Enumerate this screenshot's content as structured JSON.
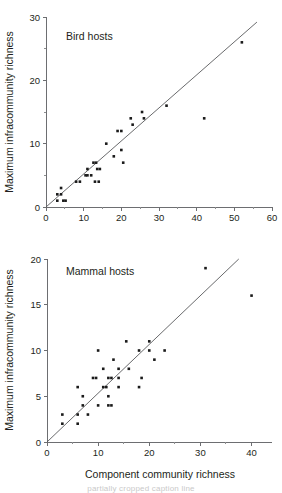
{
  "figure": {
    "shared_xlabel": "Component community richness",
    "shared_ylabel": "Maximum infracommunity richness",
    "caption_partial": "partially cropped caption line"
  },
  "chart_data": [
    {
      "type": "scatter",
      "title": "Bird hosts",
      "xlabel": "",
      "ylabel": "Maximum infracommunity richness",
      "xlim": [
        0,
        60
      ],
      "ylim": [
        0,
        30
      ],
      "xticks": [
        0,
        10,
        20,
        30,
        40,
        50,
        60
      ],
      "xticklabels": [
        "0",
        "10",
        "20",
        "30",
        "40",
        "50",
        "60"
      ],
      "xminorticks": [
        5,
        15,
        25,
        35,
        45,
        55
      ],
      "yticks": [
        0,
        10,
        20,
        30
      ],
      "yticklabels": [
        "0",
        "10",
        "20",
        "30"
      ],
      "yminorticks": [
        5,
        15,
        25
      ],
      "grid": false,
      "legend": "none",
      "trendline": {
        "x0": 0,
        "y0": 0,
        "x1": 56,
        "y1": 29.2
      },
      "points": [
        {
          "x": 3,
          "y": 1
        },
        {
          "x": 3,
          "y": 2
        },
        {
          "x": 4,
          "y": 3
        },
        {
          "x": 4,
          "y": 2
        },
        {
          "x": 4.6,
          "y": 1
        },
        {
          "x": 5.2,
          "y": 1
        },
        {
          "x": 8,
          "y": 4
        },
        {
          "x": 9,
          "y": 4
        },
        {
          "x": 10.5,
          "y": 5
        },
        {
          "x": 11,
          "y": 5
        },
        {
          "x": 11,
          "y": 6
        },
        {
          "x": 12,
          "y": 5
        },
        {
          "x": 12.6,
          "y": 7
        },
        {
          "x": 13.3,
          "y": 7
        },
        {
          "x": 13,
          "y": 4
        },
        {
          "x": 14,
          "y": 4
        },
        {
          "x": 13.6,
          "y": 6
        },
        {
          "x": 14.3,
          "y": 6
        },
        {
          "x": 16,
          "y": 10
        },
        {
          "x": 18,
          "y": 8
        },
        {
          "x": 19,
          "y": 12
        },
        {
          "x": 20,
          "y": 12
        },
        {
          "x": 20,
          "y": 9
        },
        {
          "x": 20.5,
          "y": 7
        },
        {
          "x": 22.5,
          "y": 14
        },
        {
          "x": 23,
          "y": 13
        },
        {
          "x": 25.5,
          "y": 15
        },
        {
          "x": 26,
          "y": 14
        },
        {
          "x": 32,
          "y": 16
        },
        {
          "x": 42,
          "y": 14
        },
        {
          "x": 52,
          "y": 26
        }
      ]
    },
    {
      "type": "scatter",
      "title": "Mammal hosts",
      "xlabel": "Component community richness",
      "ylabel": "Maximum infracommunity richness",
      "xlim": [
        0,
        44
      ],
      "ylim": [
        0,
        20
      ],
      "xticks": [
        0,
        10,
        20,
        30,
        40
      ],
      "xticklabels": [
        "0",
        "10",
        "20",
        "30",
        "40"
      ],
      "xminorticks": [
        5,
        15,
        25,
        35
      ],
      "yticks": [
        0,
        5,
        10,
        15,
        20
      ],
      "yticklabels": [
        "0",
        "5",
        "10",
        "15",
        "20"
      ],
      "yminorticks": [],
      "grid": false,
      "legend": "none",
      "trendline": {
        "x0": 0,
        "y0": 0,
        "x1": 37.5,
        "y1": 20
      },
      "points": [
        {
          "x": 3,
          "y": 3
        },
        {
          "x": 3,
          "y": 2
        },
        {
          "x": 6,
          "y": 3
        },
        {
          "x": 6,
          "y": 2
        },
        {
          "x": 6,
          "y": 6
        },
        {
          "x": 7,
          "y": 4
        },
        {
          "x": 7,
          "y": 5
        },
        {
          "x": 8,
          "y": 3
        },
        {
          "x": 9,
          "y": 7
        },
        {
          "x": 9.6,
          "y": 7
        },
        {
          "x": 10,
          "y": 10
        },
        {
          "x": 10,
          "y": 4
        },
        {
          "x": 11,
          "y": 8
        },
        {
          "x": 11,
          "y": 6
        },
        {
          "x": 11.6,
          "y": 6
        },
        {
          "x": 12,
          "y": 7
        },
        {
          "x": 12.6,
          "y": 7
        },
        {
          "x": 12,
          "y": 5
        },
        {
          "x": 12,
          "y": 4
        },
        {
          "x": 12.6,
          "y": 4
        },
        {
          "x": 13,
          "y": 9
        },
        {
          "x": 14,
          "y": 7
        },
        {
          "x": 14,
          "y": 8
        },
        {
          "x": 14,
          "y": 6
        },
        {
          "x": 15.5,
          "y": 11
        },
        {
          "x": 16,
          "y": 8
        },
        {
          "x": 18,
          "y": 10
        },
        {
          "x": 18,
          "y": 6
        },
        {
          "x": 18.5,
          "y": 7
        },
        {
          "x": 20,
          "y": 11
        },
        {
          "x": 20,
          "y": 10
        },
        {
          "x": 21,
          "y": 9
        },
        {
          "x": 23,
          "y": 10
        },
        {
          "x": 31,
          "y": 19
        },
        {
          "x": 40,
          "y": 16
        }
      ]
    }
  ]
}
